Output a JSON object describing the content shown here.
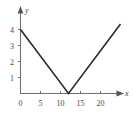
{
  "chart_data": {
    "type": "line",
    "title": "",
    "subtitle": "",
    "xlabel": "x",
    "ylabel": "y",
    "xlim": [
      0,
      25.5
    ],
    "ylim": [
      0,
      4.8
    ],
    "grid": false,
    "legend": null,
    "xticks": [
      0,
      5,
      10,
      15,
      20
    ],
    "xtick_labels": [
      "0",
      "5",
      "10",
      "15",
      "20"
    ],
    "yticks": [
      1,
      2,
      3,
      4
    ],
    "ytick_labels": [
      "1",
      "2",
      "3",
      "4"
    ],
    "axis_arrows": [
      "x",
      "y"
    ],
    "series": [
      {
        "name": "y = |x - 12| / 3",
        "points": [
          {
            "x": 0,
            "y": 4.0
          },
          {
            "x": 12,
            "y": 0.0
          },
          {
            "x": 25,
            "y": 4.35
          }
        ],
        "color": "#2b2b2b",
        "vertex": {
          "x": 12,
          "y": 0
        }
      }
    ],
    "annotations": []
  },
  "labels": {
    "x_axis_name": "x",
    "y_axis_name": "y",
    "x_tick_0": "0",
    "x_tick_5": "5",
    "x_tick_10": "10",
    "x_tick_15": "15",
    "x_tick_20": "20",
    "y_tick_1": "1",
    "y_tick_2": "2",
    "y_tick_3": "3",
    "y_tick_4": "4"
  }
}
